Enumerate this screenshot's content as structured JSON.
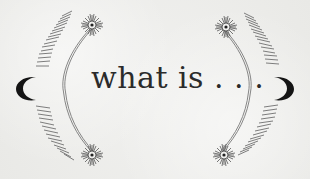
{
  "heading": {
    "text": "what is . . ."
  },
  "colors": {
    "background": "#ececea",
    "ink": "#2b2b2b",
    "line": "#6e6e6e",
    "moon": "#141414"
  },
  "decorations": {
    "left": [
      "crescent-moon-icon",
      "hatched-arc",
      "double-line-bracket",
      "sunburst-icon-top",
      "sunburst-icon-bottom"
    ],
    "right": [
      "crescent-moon-icon",
      "hatched-arc",
      "double-line-bracket",
      "sunburst-icon-top",
      "sunburst-icon-bottom"
    ]
  }
}
